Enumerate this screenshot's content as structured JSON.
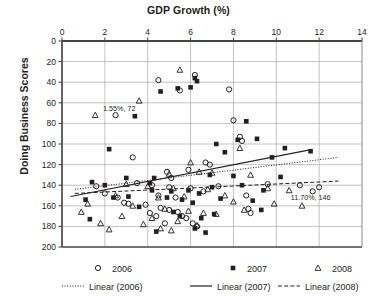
{
  "chart_data": {
    "type": "scatter",
    "title": "GDP Growth (%)",
    "xlabel": "GDP Growth (%)",
    "ylabel": "Doing Business Scores",
    "xlim": [
      0,
      14
    ],
    "ylim": [
      0,
      200
    ],
    "y_inverted": true,
    "xticks": [
      "0",
      "2",
      "4",
      "6",
      "8",
      "10",
      "12",
      "14"
    ],
    "yticks": [
      "0",
      "20",
      "40",
      "60",
      "80",
      "100",
      "120",
      "140",
      "160",
      "180",
      "200"
    ],
    "grid": "both",
    "legend_position": "bottom",
    "annotations": [
      {
        "label": "1.55%, 72",
        "x": 1.55,
        "y": 72
      },
      {
        "label": "11.70%, 146",
        "x": 11.7,
        "y": 146
      }
    ],
    "series": [
      {
        "name": "2006",
        "marker": "open-circle",
        "points": [
          [
            4.5,
            38
          ],
          [
            5.5,
            48
          ],
          [
            6.2,
            33
          ],
          [
            7.8,
            47
          ],
          [
            2.5,
            72
          ],
          [
            8.0,
            77
          ],
          [
            8.3,
            93
          ],
          [
            8.4,
            97
          ],
          [
            3.3,
            113
          ],
          [
            4.9,
            127
          ],
          [
            6.7,
            118
          ],
          [
            6.9,
            120
          ],
          [
            5.9,
            125
          ],
          [
            5.1,
            133
          ],
          [
            3.5,
            138
          ],
          [
            1.6,
            141
          ],
          [
            4.2,
            140
          ],
          [
            5.0,
            142
          ],
          [
            6.0,
            143
          ],
          [
            6.6,
            146
          ],
          [
            7.3,
            141
          ],
          [
            9.6,
            139
          ],
          [
            11.1,
            140
          ],
          [
            12.0,
            142
          ],
          [
            2.0,
            148
          ],
          [
            2.6,
            152
          ],
          [
            4.5,
            150
          ],
          [
            5.3,
            152
          ],
          [
            8.6,
            150
          ],
          [
            3.1,
            158
          ],
          [
            4.6,
            162
          ],
          [
            5.0,
            164
          ],
          [
            5.4,
            166
          ],
          [
            4.1,
            167
          ],
          [
            4.4,
            170
          ],
          [
            5.6,
            170
          ],
          [
            5.8,
            172
          ],
          [
            2.9,
            157
          ],
          [
            3.9,
            159
          ],
          [
            11.7,
            146
          ],
          [
            8.7,
            163
          ],
          [
            8.8,
            167
          ],
          [
            6.1,
            177
          ],
          [
            6.3,
            180
          ],
          [
            4.8,
            177
          ]
        ]
      },
      {
        "name": "2007",
        "marker": "filled-square",
        "points": [
          [
            6.2,
            36
          ],
          [
            6.3,
            39
          ],
          [
            5.4,
            46
          ],
          [
            6.0,
            45
          ],
          [
            4.6,
            49
          ],
          [
            3.4,
            73
          ],
          [
            8.6,
            78
          ],
          [
            8.2,
            96
          ],
          [
            9.1,
            95
          ],
          [
            2.2,
            105
          ],
          [
            7.2,
            100
          ],
          [
            7.6,
            108
          ],
          [
            9.8,
            113
          ],
          [
            10.4,
            104
          ],
          [
            11.6,
            107
          ],
          [
            3.0,
            133
          ],
          [
            4.3,
            133
          ],
          [
            6.9,
            130
          ],
          [
            8.0,
            131
          ],
          [
            10.2,
            132
          ],
          [
            1.4,
            137
          ],
          [
            2.0,
            140
          ],
          [
            4.1,
            138
          ],
          [
            4.2,
            145
          ],
          [
            5.1,
            146
          ],
          [
            5.9,
            145
          ],
          [
            6.4,
            148
          ],
          [
            7.0,
            142
          ],
          [
            8.4,
            140
          ],
          [
            9.4,
            145
          ],
          [
            1.1,
            154
          ],
          [
            2.4,
            152
          ],
          [
            3.1,
            151
          ],
          [
            4.9,
            152
          ],
          [
            5.6,
            154
          ],
          [
            6.1,
            157
          ],
          [
            7.4,
            153
          ],
          [
            8.9,
            155
          ],
          [
            1.3,
            173
          ],
          [
            3.6,
            161
          ],
          [
            5.2,
            166
          ],
          [
            5.5,
            170
          ],
          [
            6.5,
            172
          ],
          [
            7.1,
            168
          ],
          [
            9.3,
            164
          ],
          [
            4.4,
            185
          ],
          [
            6.2,
            182
          ],
          [
            6.7,
            186
          ]
        ]
      },
      {
        "name": "2008",
        "marker": "open-triangle",
        "points": [
          [
            5.5,
            28
          ],
          [
            3.6,
            58
          ],
          [
            1.55,
            72
          ],
          [
            8.3,
            104
          ],
          [
            6.0,
            118
          ],
          [
            6.4,
            127
          ],
          [
            5.0,
            129
          ],
          [
            7.0,
            128
          ],
          [
            8.8,
            130
          ],
          [
            3.0,
            139
          ],
          [
            4.0,
            141
          ],
          [
            5.2,
            143
          ],
          [
            6.8,
            144
          ],
          [
            9.6,
            143
          ],
          [
            10.6,
            145
          ],
          [
            2.5,
            150
          ],
          [
            4.5,
            152
          ],
          [
            5.7,
            151
          ],
          [
            7.6,
            150
          ],
          [
            8.0,
            156
          ],
          [
            1.2,
            158
          ],
          [
            3.3,
            160
          ],
          [
            4.8,
            163
          ],
          [
            5.9,
            165
          ],
          [
            6.6,
            167
          ],
          [
            2.8,
            170
          ],
          [
            4.2,
            172
          ],
          [
            5.4,
            175
          ],
          [
            7.2,
            168
          ],
          [
            8.5,
            164
          ],
          [
            1.8,
            177
          ],
          [
            3.8,
            178
          ],
          [
            6.3,
            179
          ],
          [
            4.6,
            182
          ],
          [
            5.1,
            184
          ],
          [
            11.2,
            160
          ],
          [
            9.9,
            158
          ],
          [
            0.9,
            166
          ],
          [
            2.2,
            183
          ]
        ]
      }
    ],
    "trendlines": [
      {
        "name": "Linear (2006)",
        "style": "dotted",
        "x1": 0.6,
        "y1": 144,
        "x2": 12.9,
        "y2": 113
      },
      {
        "name": "Linear (2007)",
        "style": "solid",
        "x1": 0.4,
        "y1": 151,
        "x2": 11.5,
        "y2": 106
      },
      {
        "name": "Linear (2008)",
        "style": "dashed",
        "x1": 0.6,
        "y1": 148,
        "x2": 12.9,
        "y2": 136
      }
    ]
  },
  "legend": {
    "markers": [
      {
        "label": "2006",
        "symbol": "open-circle"
      },
      {
        "label": "2007",
        "symbol": "filled-square"
      },
      {
        "label": "2008",
        "symbol": "open-triangle"
      }
    ],
    "lines": [
      {
        "label": "Linear (2006)",
        "style": "dotted"
      },
      {
        "label": "Linear (2007)",
        "style": "solid"
      },
      {
        "label": "Linear (2008)",
        "style": "dashed"
      }
    ]
  },
  "colors": {
    "ink": "#231f20",
    "grid": "#9a9a9a",
    "axis": "#3a3a3a",
    "background": "#ffffff"
  }
}
